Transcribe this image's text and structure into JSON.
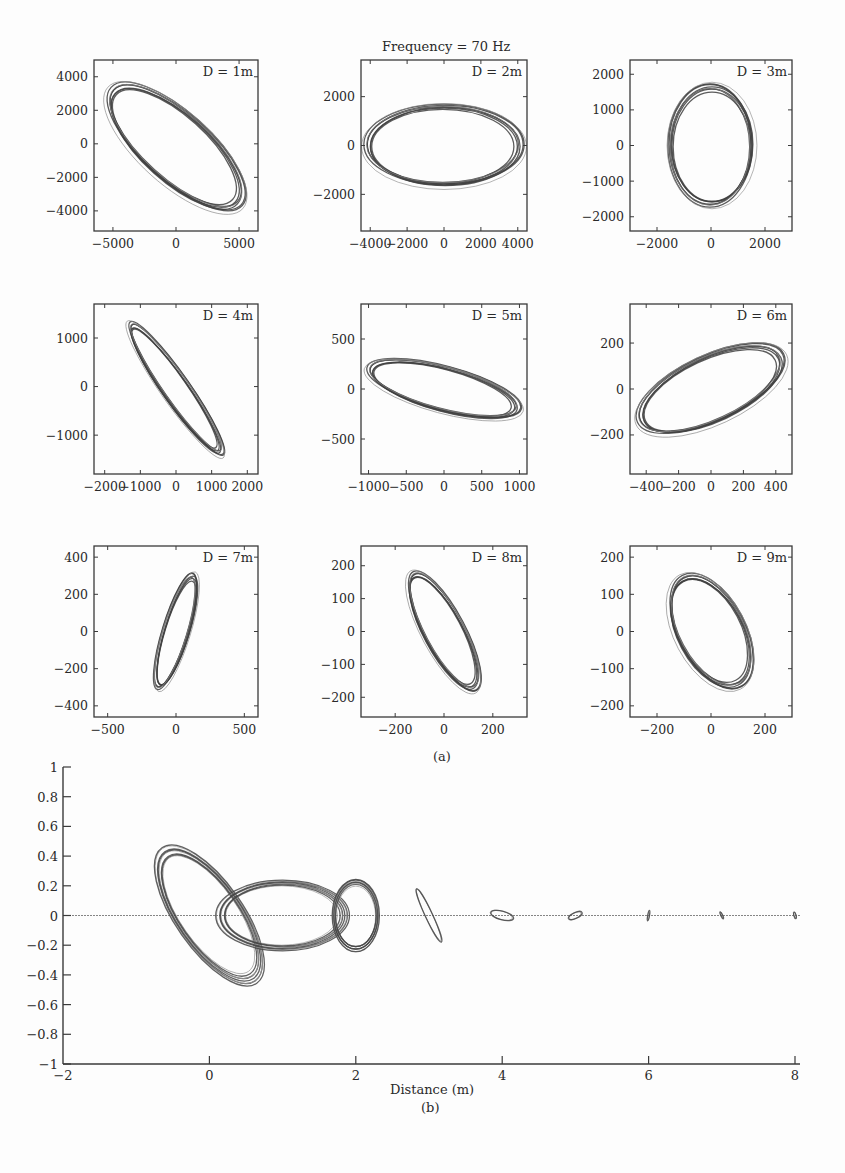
{
  "figure": {
    "title": "Frequency = 70 Hz",
    "caption_a": "(a)",
    "caption_b": "(b)",
    "colors": {
      "ink": "#3a3a3a",
      "trace_dark": "#404040",
      "trace_light": "#8a8a8a",
      "background": "#fdfdfd"
    }
  },
  "chart_data": [
    {
      "type": "scatter",
      "title": "Frequency = 70 Hz",
      "subtitle": "Panel (a): particle-motion orbits at distance D",
      "panels": [
        {
          "label": "D = 1m",
          "xlim": [
            -6500,
            6500
          ],
          "ylim": [
            -5200,
            5000
          ],
          "xticks": [
            -5000,
            0,
            5000
          ],
          "yticks": [
            -4000,
            -2000,
            0,
            2000,
            4000
          ],
          "ellipse": {
            "cx": 0,
            "cy": -200,
            "a": 6600,
            "b": 2600,
            "angle_deg": -42
          }
        },
        {
          "label": "D = 2m",
          "xlim": [
            -4500,
            4500
          ],
          "ylim": [
            -3500,
            3500
          ],
          "xticks": [
            -4000,
            -2000,
            0,
            2000,
            4000
          ],
          "yticks": [
            -2000,
            0,
            2000
          ],
          "ellipse": {
            "cx": 0,
            "cy": 0,
            "a": 4100,
            "b": 2100,
            "angle_deg": 0
          }
        },
        {
          "label": "D = 3m",
          "xlim": [
            -3000,
            3000
          ],
          "ylim": [
            -2400,
            2400
          ],
          "xticks": [
            -2000,
            0,
            2000
          ],
          "yticks": [
            -2000,
            -1000,
            0,
            1000,
            2000
          ],
          "ellipse": {
            "cx": 0,
            "cy": 0,
            "a": 2150,
            "b": 1500,
            "angle_deg": 90
          }
        },
        {
          "label": "D = 4m",
          "xlim": [
            -2300,
            2300
          ],
          "ylim": [
            -1800,
            1700
          ],
          "xticks": [
            -2000,
            -1000,
            0,
            1000,
            2000
          ],
          "yticks": [
            -1000,
            0,
            1000
          ],
          "ellipse": {
            "cx": 0,
            "cy": -50,
            "a": 2150,
            "b": 360,
            "angle_deg": -55
          }
        },
        {
          "label": "D = 5m",
          "xlim": [
            -1100,
            1100
          ],
          "ylim": [
            -850,
            850
          ],
          "xticks": [
            -1000,
            -500,
            0,
            500,
            1000
          ],
          "yticks": [
            -500,
            0,
            500
          ],
          "ellipse": {
            "cx": 0,
            "cy": 0,
            "a": 1000,
            "b": 280,
            "angle_deg": -15
          }
        },
        {
          "label": "D = 6m",
          "xlim": [
            -500,
            500
          ],
          "ylim": [
            -370,
            370
          ],
          "xticks": [
            -400,
            -200,
            0,
            200,
            400
          ],
          "yticks": [
            -200,
            0,
            200
          ],
          "ellipse": {
            "cx": 0,
            "cy": 0,
            "a": 470,
            "b": 195,
            "angle_deg": 25
          }
        },
        {
          "label": "D = 7m",
          "xlim": [
            -600,
            600
          ],
          "ylim": [
            -460,
            460
          ],
          "xticks": [
            -500,
            0,
            500
          ],
          "yticks": [
            -400,
            -200,
            0,
            200,
            400
          ],
          "ellipse": {
            "cx": 0,
            "cy": 0,
            "a": 420,
            "b": 90,
            "angle_deg": 73
          }
        },
        {
          "label": "D = 8m",
          "xlim": [
            -340,
            340
          ],
          "ylim": [
            -260,
            260
          ],
          "xticks": [
            -200,
            0,
            200
          ],
          "yticks": [
            -200,
            -100,
            0,
            100,
            200
          ],
          "ellipse": {
            "cx": 0,
            "cy": 0,
            "a": 260,
            "b": 80,
            "angle_deg": -62
          }
        },
        {
          "label": "D = 9m",
          "xlim": [
            -300,
            300
          ],
          "ylim": [
            -230,
            230
          ],
          "xticks": [
            -200,
            0,
            200
          ],
          "yticks": [
            -200,
            -100,
            0,
            100,
            200
          ],
          "ellipse": {
            "cx": 0,
            "cy": 0,
            "a": 220,
            "b": 120,
            "angle_deg": -62
          }
        }
      ]
    },
    {
      "type": "line",
      "title": "Panel (b): normalized orbits vs distance",
      "xlabel": "Distance (m)",
      "ylabel": "",
      "xlim": [
        -2,
        8.1
      ],
      "ylim": [
        -1,
        1
      ],
      "xticks": [
        -2,
        0,
        2,
        4,
        6,
        8
      ],
      "yticks": [
        -1,
        -0.8,
        -0.6,
        -0.4,
        -0.2,
        0,
        0.2,
        0.4,
        0.6,
        0.8,
        1
      ],
      "ytick_labels": [
        "−1",
        "−0.8",
        "−0.6",
        "−0.4",
        "−0.2",
        "0",
        "0.2",
        "0.4",
        "0.6",
        "0.8",
        "1"
      ],
      "xtick_labels": [
        "−2",
        "0",
        "2",
        "4",
        "6",
        "8"
      ],
      "reference_line_y": 0,
      "grid": false,
      "orbits": [
        {
          "distance": 0,
          "cx": 0,
          "cy": 0,
          "a": 1.05,
          "b": 0.43,
          "angle_deg": -55
        },
        {
          "distance": 1,
          "cx": 1.0,
          "cy": 0,
          "a": 0.85,
          "b": 0.45,
          "angle_deg": 0
        },
        {
          "distance": 2,
          "cx": 2.0,
          "cy": 0,
          "a": 0.46,
          "b": 0.3,
          "angle_deg": 90
        },
        {
          "distance": 3,
          "cx": 3.0,
          "cy": 0,
          "a": 0.4,
          "b": 0.05,
          "angle_deg": -65
        },
        {
          "distance": 4,
          "cx": 4.0,
          "cy": 0,
          "a": 0.16,
          "b": 0.06,
          "angle_deg": -15
        },
        {
          "distance": 5,
          "cx": 5.0,
          "cy": 0,
          "a": 0.1,
          "b": 0.04,
          "angle_deg": 25
        },
        {
          "distance": 6,
          "cx": 6.0,
          "cy": 0,
          "a": 0.07,
          "b": 0.012,
          "angle_deg": 80
        },
        {
          "distance": 7,
          "cx": 7.0,
          "cy": 0,
          "a": 0.05,
          "b": 0.012,
          "angle_deg": -65
        },
        {
          "distance": 8,
          "cx": 8.0,
          "cy": 0,
          "a": 0.045,
          "b": 0.015,
          "angle_deg": -75
        }
      ]
    }
  ]
}
